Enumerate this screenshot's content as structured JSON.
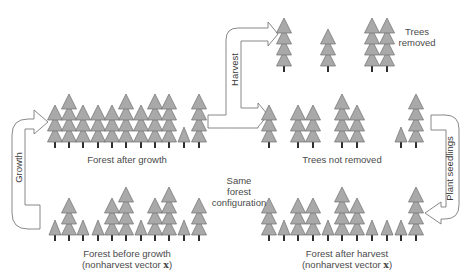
{
  "diagram": {
    "colors": {
      "tree_fill": "#a9a9a9",
      "tree_stroke": "#6e6e6e",
      "trunk": "#2e2e2e",
      "arrow_stroke": "#7a7a7a",
      "text": "#4a4a4a"
    },
    "labels": {
      "forest_after_growth": "Forest after growth",
      "forest_before_growth": "Forest before growth",
      "forest_before_growth_sub": "(nonharvest vector ",
      "trees_removed_line1": "Trees",
      "trees_removed_line2": "removed",
      "trees_not_removed": "Trees not removed",
      "same_line1": "Same",
      "same_line2": "forest",
      "same_line3": "configuration",
      "forest_after_harvest": "Forest after harvest",
      "forest_after_harvest_sub": "(nonharvest vector ",
      "vector_symbol": "x",
      "close_paren": ")"
    },
    "arrows": {
      "growth": "Growth",
      "harvest": "Harvest",
      "plant_seedlings": "Plant seedlings"
    },
    "forests": {
      "before_growth": {
        "base_y": 241,
        "trees": [
          {
            "x": 55,
            "tiers": 1
          },
          {
            "x": 69,
            "tiers": 3
          },
          {
            "x": 83,
            "tiers": 1
          },
          {
            "x": 98,
            "tiers": 1
          },
          {
            "x": 112,
            "tiers": 3
          },
          {
            "x": 126,
            "tiers": 4
          },
          {
            "x": 141,
            "tiers": 1
          },
          {
            "x": 155,
            "tiers": 3
          },
          {
            "x": 169,
            "tiers": 4
          },
          {
            "x": 184,
            "tiers": 1
          },
          {
            "x": 199,
            "tiers": 3
          }
        ]
      },
      "after_growth": {
        "base_y": 148,
        "trees": [
          {
            "x": 55,
            "tiers": 3
          },
          {
            "x": 69,
            "tiers": 4
          },
          {
            "x": 83,
            "tiers": 3
          },
          {
            "x": 98,
            "tiers": 3
          },
          {
            "x": 112,
            "tiers": 3
          },
          {
            "x": 126,
            "tiers": 4
          },
          {
            "x": 141,
            "tiers": 3
          },
          {
            "x": 155,
            "tiers": 4
          },
          {
            "x": 169,
            "tiers": 4
          },
          {
            "x": 184,
            "tiers": 1
          },
          {
            "x": 199,
            "tiers": 4
          }
        ]
      },
      "trees_removed": {
        "base_y": 72,
        "trees": [
          {
            "x": 284,
            "tiers": 4
          },
          {
            "x": 328,
            "tiers": 3
          },
          {
            "x": 372,
            "tiers": 4
          },
          {
            "x": 387,
            "tiers": 4
          }
        ]
      },
      "trees_not_removed": {
        "base_y": 148,
        "trees": [
          {
            "x": 269,
            "tiers": 3
          },
          {
            "x": 298,
            "tiers": 3
          },
          {
            "x": 313,
            "tiers": 3
          },
          {
            "x": 342,
            "tiers": 4
          },
          {
            "x": 357,
            "tiers": 3
          },
          {
            "x": 401,
            "tiers": 1
          },
          {
            "x": 416,
            "tiers": 4
          }
        ]
      },
      "after_harvest": {
        "base_y": 241,
        "trees": [
          {
            "x": 269,
            "tiers": 3
          },
          {
            "x": 284,
            "tiers": 1
          },
          {
            "x": 298,
            "tiers": 3
          },
          {
            "x": 313,
            "tiers": 3
          },
          {
            "x": 328,
            "tiers": 1
          },
          {
            "x": 342,
            "tiers": 4
          },
          {
            "x": 357,
            "tiers": 3
          },
          {
            "x": 372,
            "tiers": 1
          },
          {
            "x": 387,
            "tiers": 1
          },
          {
            "x": 401,
            "tiers": 1
          },
          {
            "x": 416,
            "tiers": 4
          }
        ]
      }
    }
  }
}
